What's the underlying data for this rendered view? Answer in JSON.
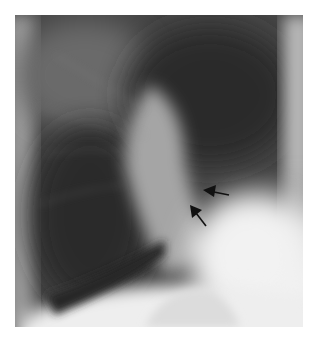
{
  "figure": {
    "type": "lateral chest radiograph",
    "annotations": [
      {
        "kind": "arrow",
        "direction": "left",
        "label": ""
      },
      {
        "kind": "arrow",
        "direction": "up-left",
        "label": ""
      }
    ],
    "colors": {
      "background": "#ffffff",
      "arrow": "#111111"
    }
  }
}
